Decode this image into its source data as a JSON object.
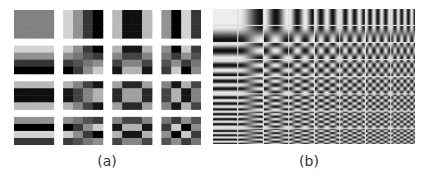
{
  "figure": {
    "panels": [
      {
        "id": "a",
        "label": "(a)",
        "description": "4x4 DCT basis functions",
        "grid_size": 4,
        "tile_resolution": 4,
        "gap_color": "#ffffff"
      },
      {
        "id": "b",
        "label": "(b)",
        "description": "8x8 DCT basis functions",
        "grid_size": 8,
        "tile_resolution": 8,
        "gap_color": "#d8d8d8"
      }
    ]
  }
}
